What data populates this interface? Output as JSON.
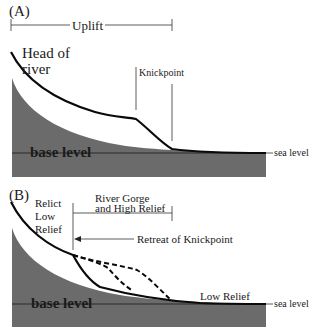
{
  "colors": {
    "terrain_fill": "#6b6b6b",
    "river_line": "#0a0a0a",
    "annotation_line": "#333333",
    "background": "#ffffff",
    "text": "#1a1a1a"
  },
  "panel_a": {
    "label": "(A)",
    "uplift_label": "Uplift",
    "head_label_line1": "Head of",
    "head_label_line2": "river",
    "knickpoint_label": "Knickpoint",
    "base_level_label": "base level",
    "sea_level_label": "sea level"
  },
  "panel_b": {
    "label": "(B)",
    "relict_line1": "Relict",
    "relict_line2": "Low",
    "relict_line3": "Relief",
    "gorge_line1": "River Gorge",
    "gorge_line2": "and High Relief",
    "retreat_label": "Retreat of Knickpoint",
    "low_relief_label": "Low Relief",
    "base_level_label": "base level",
    "sea_level_label": "sea level"
  }
}
